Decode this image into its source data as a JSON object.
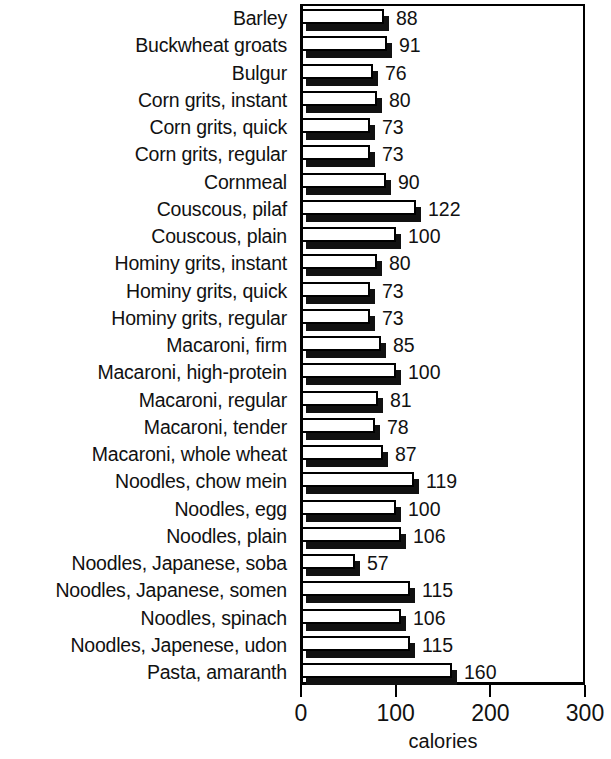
{
  "chart_data": {
    "type": "bar",
    "orientation": "horizontal",
    "title": "",
    "xlabel": "calories",
    "ylabel": "",
    "xlim": [
      0,
      300
    ],
    "xticks": [
      0,
      100,
      200,
      300
    ],
    "xtick_labels": [
      "0",
      "100",
      "200",
      "300"
    ],
    "grid": false,
    "legend": null,
    "data_labels": true,
    "categories": [
      "Barley",
      "Buckwheat groats",
      "Bulgur",
      "Corn grits, instant",
      "Corn grits, quick",
      "Corn grits, regular",
      "Cornmeal",
      "Couscous, pilaf",
      "Couscous, plain",
      "Hominy grits, instant",
      "Hominy grits, quick",
      "Hominy grits, regular",
      "Macaroni, firm",
      "Macaroni, high-protein",
      "Macaroni, regular",
      "Macaroni, tender",
      "Macaroni, whole wheat",
      "Noodles, chow mein",
      "Noodles, egg",
      "Noodles, plain",
      "Noodles, Japanese, soba",
      "Noodles, Japanese, somen",
      "Noodles, spinach",
      "Noodles, Japenese, udon",
      "Pasta, amaranth"
    ],
    "values": [
      88,
      91,
      76,
      80,
      73,
      73,
      90,
      122,
      100,
      80,
      73,
      73,
      85,
      100,
      81,
      78,
      87,
      119,
      100,
      106,
      57,
      115,
      106,
      115,
      160
    ],
    "value_labels": [
      "88",
      "91",
      "76",
      "80",
      "73",
      "73",
      "90",
      "122",
      "100",
      "80",
      "73",
      "73",
      "85",
      "100",
      "81",
      "78",
      "87",
      "119",
      "100",
      "106",
      "57",
      "115",
      "106",
      "115",
      "160"
    ],
    "colors": {
      "bar_face": "#ffffff",
      "bar_outline": "#000000",
      "bar_shadow": "#111111",
      "axis": "#000000",
      "text": "#111111",
      "background": "#ffffff"
    }
  }
}
